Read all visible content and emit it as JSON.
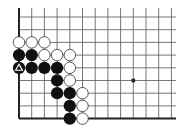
{
  "board": {
    "description": "Go board diagram (lower-left corner region)",
    "grid": {
      "origin_x": 19,
      "origin_y": 17,
      "spacing": 12.7,
      "columns": 13,
      "rows": 9,
      "line_extend_right": 176,
      "line_extend_top": 8,
      "left_edge_is_board_edge": true,
      "bottom_edge_is_board_edge": true
    },
    "colors": {
      "background": "#ffffff",
      "grid_line": "#555555",
      "edge_line": "#222222",
      "black_stone": "#111111",
      "white_stone_fill": "#ffffff",
      "white_stone_stroke": "#444444",
      "marker": "#ffffff"
    },
    "star_points": [
      {
        "col": 9,
        "row": 5
      }
    ],
    "stones": [
      {
        "color": "white",
        "col": 0,
        "row": 2
      },
      {
        "color": "white",
        "col": 1,
        "row": 2
      },
      {
        "color": "white",
        "col": 2,
        "row": 2
      },
      {
        "color": "black",
        "col": 0,
        "row": 3
      },
      {
        "color": "black",
        "col": 1,
        "row": 3
      },
      {
        "color": "white",
        "col": 2,
        "row": 3
      },
      {
        "color": "white",
        "col": 3,
        "row": 3
      },
      {
        "color": "white",
        "col": 4,
        "row": 3
      },
      {
        "color": "black",
        "col": 0,
        "row": 4,
        "marker": "triangle"
      },
      {
        "color": "black",
        "col": 1,
        "row": 4
      },
      {
        "color": "black",
        "col": 2,
        "row": 4
      },
      {
        "color": "black",
        "col": 3,
        "row": 4
      },
      {
        "color": "white",
        "col": 4,
        "row": 4
      },
      {
        "color": "black",
        "col": 3,
        "row": 5
      },
      {
        "color": "white",
        "col": 4,
        "row": 5
      },
      {
        "color": "black",
        "col": 3,
        "row": 6
      },
      {
        "color": "black",
        "col": 4,
        "row": 6
      },
      {
        "color": "white",
        "col": 5,
        "row": 6
      },
      {
        "color": "black",
        "col": 4,
        "row": 7
      },
      {
        "color": "white",
        "col": 5,
        "row": 7
      },
      {
        "color": "black",
        "col": 4,
        "row": 8
      },
      {
        "color": "white",
        "col": 5,
        "row": 8
      }
    ]
  }
}
